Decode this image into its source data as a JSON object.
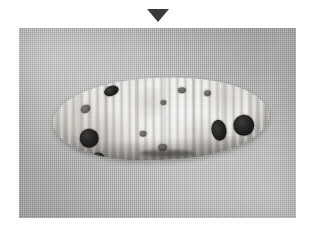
{
  "figure": {
    "caption": "",
    "marker": {
      "name": "down-triangle-marker",
      "glyph": "▼",
      "color": "#3a3a3a",
      "position": "top-center"
    },
    "photo": {
      "alt_text": "Grayscale photograph of an elongated segmented larva-like specimen lying on a woven cloth backdrop",
      "color_mode": "grayscale",
      "background_color": "#b8b8b7",
      "background_texture": "woven-cloth",
      "frame": {
        "x": 19,
        "y": 28,
        "width": 277,
        "height": 190
      }
    },
    "specimen": {
      "label": "",
      "body_color": "#e9e7e2",
      "highlight_color": "#f4f3f0",
      "shadow_color": "#a9a5a0",
      "surface": "transverse-ridged-segments",
      "orientation": "horizontal",
      "marking_color": "#1d1c1a",
      "marking_count": 11,
      "markings": [
        {
          "id": "spot-a",
          "size": "small",
          "region": "dorsal-left"
        },
        {
          "id": "spot-b",
          "size": "large",
          "region": "anterior-left"
        },
        {
          "id": "spot-c",
          "size": "small",
          "region": "ventral-left"
        },
        {
          "id": "spot-d",
          "size": "medium",
          "region": "posterior-right"
        },
        {
          "id": "spot-e",
          "size": "large",
          "region": "posterior-right"
        },
        {
          "id": "spot-f",
          "size": "faint",
          "region": "anterior-edge"
        },
        {
          "id": "spot-g",
          "size": "faint",
          "region": "mid-ventral"
        },
        {
          "id": "spot-h",
          "size": "faint",
          "region": "mid-dorsal"
        },
        {
          "id": "spot-i",
          "size": "faint",
          "region": "mid-dorsal"
        },
        {
          "id": "spot-j",
          "size": "faint",
          "region": "mid-body"
        },
        {
          "id": "spot-k",
          "size": "faint",
          "region": "mid-dorsal"
        }
      ]
    }
  }
}
